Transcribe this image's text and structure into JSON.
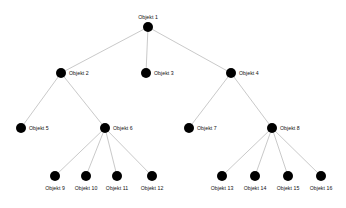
{
  "diagram": {
    "type": "tree",
    "background_color": "#ffffff",
    "node_color": "#000000",
    "edge_color": "#c3c3c3",
    "nodes": [
      {
        "id": "n1",
        "label": "Objekt 1",
        "x": 148,
        "y": 27,
        "level": 0,
        "label_position": "above",
        "parent": null
      },
      {
        "id": "n2",
        "label": "Objekt 2",
        "x": 61,
        "y": 73,
        "level": 1,
        "label_position": "right",
        "parent": "n1"
      },
      {
        "id": "n3",
        "label": "Objekt 3",
        "x": 146,
        "y": 73,
        "level": 1,
        "label_position": "right",
        "parent": "n1"
      },
      {
        "id": "n4",
        "label": "Objekt 4",
        "x": 231,
        "y": 73,
        "level": 1,
        "label_position": "right",
        "parent": "n1"
      },
      {
        "id": "n5",
        "label": "Objekt 5",
        "x": 21,
        "y": 128,
        "level": 2,
        "label_position": "right",
        "parent": "n2"
      },
      {
        "id": "n6",
        "label": "Objekt 6",
        "x": 105,
        "y": 128,
        "level": 2,
        "label_position": "right",
        "parent": "n2"
      },
      {
        "id": "n7",
        "label": "Objekt 7",
        "x": 189,
        "y": 128,
        "level": 2,
        "label_position": "right",
        "parent": "n4"
      },
      {
        "id": "n8",
        "label": "Objekt 8",
        "x": 272,
        "y": 128,
        "level": 2,
        "label_position": "right",
        "parent": "n4"
      },
      {
        "id": "n9",
        "label": "Objekt 9",
        "x": 55,
        "y": 176,
        "level": 3,
        "label_position": "below",
        "parent": "n6"
      },
      {
        "id": "n10",
        "label": "Objekt 10",
        "x": 86,
        "y": 176,
        "level": 3,
        "label_position": "below",
        "parent": "n6"
      },
      {
        "id": "n11",
        "label": "Objekt 11",
        "x": 117,
        "y": 176,
        "level": 3,
        "label_position": "below",
        "parent": "n6"
      },
      {
        "id": "n12",
        "label": "Objekt 12",
        "x": 152,
        "y": 176,
        "level": 3,
        "label_position": "below",
        "parent": "n6"
      },
      {
        "id": "n13",
        "label": "Objekt 13",
        "x": 222,
        "y": 176,
        "level": 3,
        "label_position": "below",
        "parent": "n8"
      },
      {
        "id": "n14",
        "label": "Objekt 14",
        "x": 255,
        "y": 176,
        "level": 3,
        "label_position": "below",
        "parent": "n8"
      },
      {
        "id": "n15",
        "label": "Objekt 15",
        "x": 288,
        "y": 176,
        "level": 3,
        "label_position": "below",
        "parent": "n8"
      },
      {
        "id": "n16",
        "label": "Objekt 16",
        "x": 321,
        "y": 176,
        "level": 3,
        "label_position": "below",
        "parent": "n8"
      }
    ],
    "edges": [
      {
        "from": "n1",
        "to": "n2"
      },
      {
        "from": "n1",
        "to": "n3"
      },
      {
        "from": "n1",
        "to": "n4"
      },
      {
        "from": "n2",
        "to": "n5"
      },
      {
        "from": "n2",
        "to": "n6"
      },
      {
        "from": "n4",
        "to": "n7"
      },
      {
        "from": "n4",
        "to": "n8"
      },
      {
        "from": "n6",
        "to": "n9"
      },
      {
        "from": "n6",
        "to": "n10"
      },
      {
        "from": "n6",
        "to": "n11"
      },
      {
        "from": "n6",
        "to": "n12"
      },
      {
        "from": "n8",
        "to": "n13"
      },
      {
        "from": "n8",
        "to": "n14"
      },
      {
        "from": "n8",
        "to": "n15"
      },
      {
        "from": "n8",
        "to": "n16"
      }
    ]
  }
}
